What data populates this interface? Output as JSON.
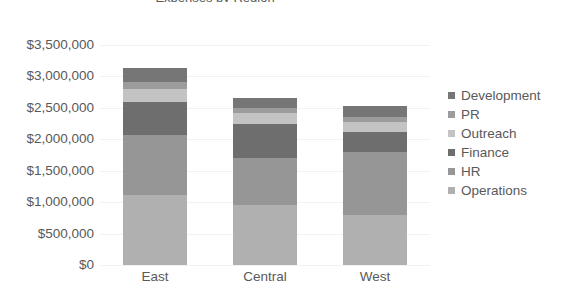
{
  "chart_data": {
    "type": "bar",
    "subtype": "stacked-bar",
    "title": "Expenses by Region",
    "xlabel": "",
    "ylabel": "",
    "categories": [
      "East",
      "Central",
      "West"
    ],
    "ylim": [
      0,
      3500000
    ],
    "ytick_values": [
      0,
      500000,
      1000000,
      1500000,
      2000000,
      2500000,
      3000000,
      3500000
    ],
    "ytick_labels": [
      "$0",
      "$500,000",
      "$1,000,000",
      "$1,500,000",
      "$2,000,000",
      "$2,500,000",
      "$3,000,000",
      "$3,500,000"
    ],
    "grid": true,
    "legend_position": "right",
    "stack_order_bottom_to_top": [
      "Operations",
      "HR",
      "Finance",
      "Outreach",
      "PR",
      "Development"
    ],
    "series": [
      {
        "name": "Development",
        "color": "#767676",
        "values": [
          225000,
          160000,
          175000
        ]
      },
      {
        "name": "PR",
        "color": "#9c9c9c",
        "values": [
          110000,
          80000,
          80000
        ]
      },
      {
        "name": "Outreach",
        "color": "#c3c3c3",
        "values": [
          205000,
          175000,
          160000
        ]
      },
      {
        "name": "Finance",
        "color": "#6e6e6e",
        "values": [
          525000,
          540000,
          320000
        ]
      },
      {
        "name": "HR",
        "color": "#969696",
        "values": [
          955000,
          745000,
          1000000
        ]
      },
      {
        "name": "Operations",
        "color": "#b0b0b0",
        "values": [
          1110000,
          955000,
          795000
        ]
      }
    ],
    "totals": [
      3130000,
      2655000,
      2530000
    ]
  },
  "legend": {
    "items": [
      {
        "label": "Development",
        "color": "#767676"
      },
      {
        "label": "PR",
        "color": "#9c9c9c"
      },
      {
        "label": "Outreach",
        "color": "#c3c3c3"
      },
      {
        "label": "Finance",
        "color": "#6e6e6e"
      },
      {
        "label": "HR",
        "color": "#969696"
      },
      {
        "label": "Operations",
        "color": "#b0b0b0"
      }
    ]
  },
  "style": {
    "gridline_color": "#f2f2f2",
    "text_color": "#595959",
    "background": "#ffffff"
  }
}
